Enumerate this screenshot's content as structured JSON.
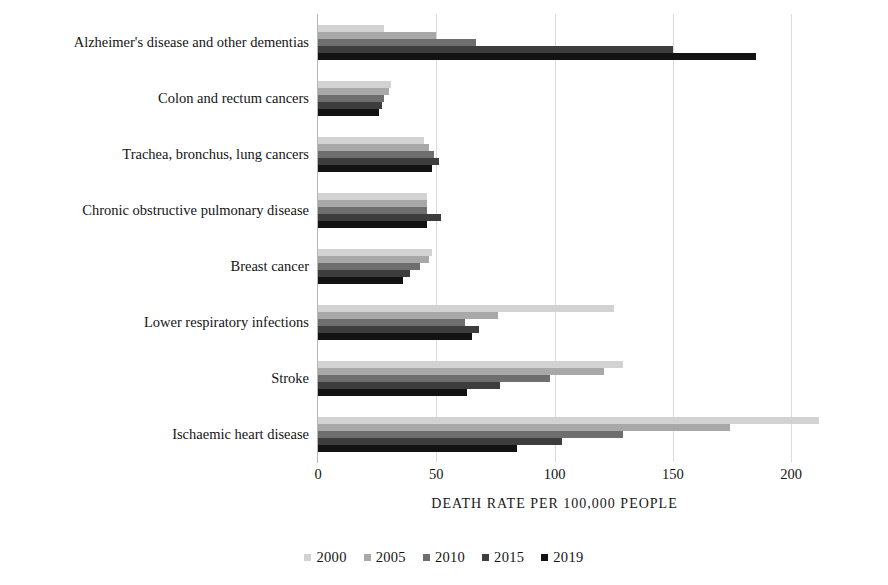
{
  "chart_data": {
    "type": "bar",
    "orientation": "horizontal",
    "title": "",
    "subtitle": "",
    "xlabel": "DEATH RATE PER 100,000 PEOPLE",
    "ylabel": "",
    "xlim": [
      0,
      212
    ],
    "axis_max_tick": 200,
    "xticks": [
      0,
      50,
      100,
      150,
      200
    ],
    "xtick_labels": [
      "0",
      "50",
      "100",
      "150",
      "200"
    ],
    "grid": "vertical-only",
    "legend_position": "bottom-center",
    "categories": [
      "Alzheimer's disease and other dementias",
      "Colon and rectum cancers",
      "Trachea, bronchus, lung cancers",
      "Chronic obstructive pulmonary disease",
      "Breast cancer",
      "Lower respiratory infections",
      "Stroke",
      "Ischaemic heart disease"
    ],
    "series": [
      {
        "name": "2000",
        "color": "#d2d2d2",
        "values": [
          28,
          31,
          45,
          46,
          48,
          125,
          129,
          212
        ]
      },
      {
        "name": "2005",
        "color": "#a8a8a8",
        "values": [
          50,
          30,
          47,
          46,
          47,
          76,
          121,
          174
        ]
      },
      {
        "name": "2010",
        "color": "#6e6e6e",
        "values": [
          67,
          28,
          49,
          46,
          43,
          62,
          98,
          129
        ]
      },
      {
        "name": "2015",
        "color": "#3d3d3d",
        "values": [
          150,
          27,
          51,
          52,
          39,
          68,
          77,
          103
        ]
      },
      {
        "name": "2019",
        "color": "#131313",
        "values": [
          185,
          26,
          48,
          46,
          36,
          65,
          63,
          84
        ]
      }
    ]
  },
  "legend": {
    "items": [
      {
        "label": "2000",
        "color": "#d2d2d2"
      },
      {
        "label": "2005",
        "color": "#a8a8a8"
      },
      {
        "label": "2010",
        "color": "#6e6e6e"
      },
      {
        "label": "2015",
        "color": "#3d3d3d"
      },
      {
        "label": "2019",
        "color": "#131313"
      }
    ]
  },
  "colors": {
    "background": "#ffffff",
    "gridline": "#d9d9d9",
    "axis": "#b7b7b7",
    "text": "#141414"
  }
}
